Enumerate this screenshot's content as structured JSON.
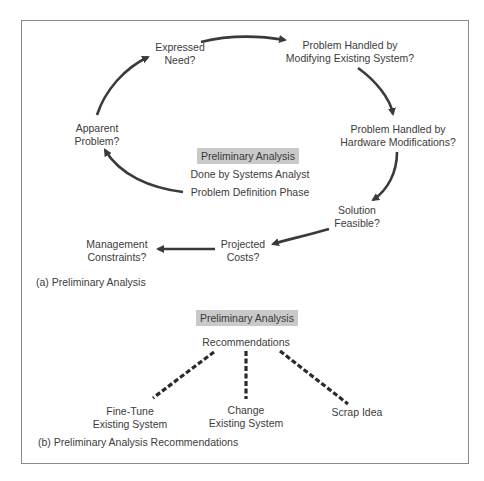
{
  "part_a": {
    "nodes": {
      "expressed_need": [
        "Expressed",
        "Need?"
      ],
      "modifying_existing": [
        "Problem Handled by",
        "Modifying Existing System?"
      ],
      "hardware_mods": [
        "Problem Handled by",
        "Hardware Modifications?"
      ],
      "solution_feasible": [
        "Solution",
        "Feasible?"
      ],
      "projected_costs": [
        "Projected",
        "Costs?"
      ],
      "management_constraints": [
        "Management",
        "Constraints?"
      ],
      "apparent_problem": [
        "Apparent",
        "Problem?"
      ]
    },
    "center": {
      "title": "Preliminary Analysis",
      "line1": "Done by Systems Analyst",
      "line2": "Problem Definition Phase"
    },
    "caption": "(a) Preliminary Analysis"
  },
  "part_b": {
    "title": "Preliminary Analysis",
    "subtitle": "Recommendations",
    "options": {
      "fine_tune": [
        "Fine-Tune",
        "Existing System"
      ],
      "change": [
        "Change",
        "Existing System"
      ],
      "scrap": [
        "Scrap Idea"
      ]
    },
    "caption": "(b) Preliminary Analysis Recommendations"
  },
  "colors": {
    "arrow": "#3a3a3a",
    "highlight": "#c9c9c9",
    "frame": "#8a8a8a"
  }
}
